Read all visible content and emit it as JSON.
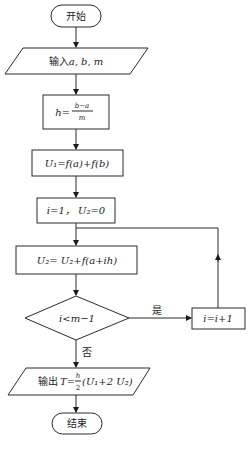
{
  "diagram": {
    "type": "flowchart",
    "nodes": {
      "start": {
        "shape": "terminal",
        "label": "开始"
      },
      "input": {
        "shape": "parallelogram",
        "label_prefix": "输入",
        "label_vars": "a, b, m"
      },
      "step_h": {
        "shape": "process",
        "lhs": "h=",
        "num": "b−a",
        "den": "m"
      },
      "step_u1": {
        "shape": "process",
        "label": "U₁=f(a)+f(b)"
      },
      "init": {
        "shape": "process",
        "label": "i=1， U₂=0"
      },
      "step_u2": {
        "shape": "process",
        "label": "U₂= U₂+f(a+ih)"
      },
      "decision": {
        "shape": "diamond",
        "label": "i<m−1"
      },
      "increment": {
        "shape": "process",
        "label": "i=i+1"
      },
      "output": {
        "shape": "parallelogram",
        "label_prefix": "输出",
        "lhs": "T=",
        "num": "h",
        "den": "2",
        "rest": "(U₁+2 U₂)"
      },
      "end": {
        "shape": "terminal",
        "label": "结束"
      }
    },
    "edges": {
      "yes_label": "是",
      "no_label": "否"
    }
  }
}
